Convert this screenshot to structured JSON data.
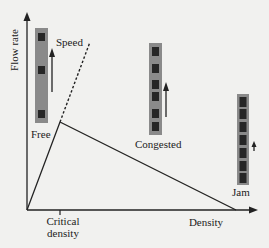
{
  "diagram": {
    "type": "fundamental-diagram-of-traffic-flow",
    "axes": {
      "y_label": "Flow rate",
      "x_label": "Density",
      "x_tick_label_line1": "Critical",
      "x_tick_label_line2": "density"
    },
    "labels": {
      "speed": "Speed",
      "free": "Free",
      "congested": "Congested",
      "jam": "Jam"
    },
    "colors": {
      "background": "#f1f1ef",
      "line": "#222222",
      "column": "#8a8a8a",
      "car": "#262626"
    },
    "states": [
      {
        "name": "Free",
        "cars": 3
      },
      {
        "name": "Congested",
        "cars": 6
      },
      {
        "name": "Jam",
        "cars": 7
      }
    ]
  }
}
